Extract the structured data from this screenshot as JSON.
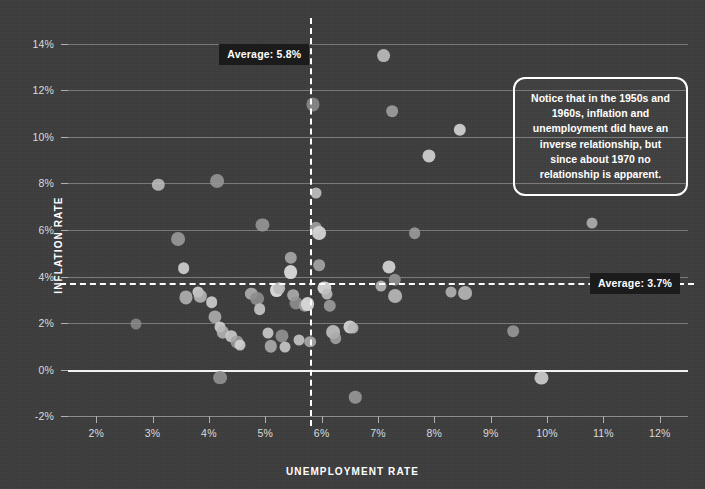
{
  "chart_data": {
    "type": "scatter",
    "title": "",
    "xlabel": "UNEMPLOYMENT RATE",
    "ylabel": "INFLATION RATE",
    "xlim": [
      1.5,
      12.5
    ],
    "ylim": [
      -2.6,
      14.6
    ],
    "xticks": [
      "2%",
      "3%",
      "4%",
      "5%",
      "6%",
      "7%",
      "8%",
      "9%",
      "10%",
      "11%",
      "12%"
    ],
    "xtick_values": [
      2,
      3,
      4,
      5,
      6,
      7,
      8,
      9,
      10,
      11,
      12
    ],
    "yticks": [
      "14%",
      "12%",
      "10%",
      "8%",
      "6%",
      "4%",
      "2%",
      "0%",
      "-2%"
    ],
    "ytick_values": [
      14,
      12,
      10,
      8,
      6,
      4,
      2,
      0,
      -2
    ],
    "grid": "horizontal",
    "legend": "none",
    "points": [
      {
        "x": 2.7,
        "y": 1.95
      },
      {
        "x": 3.1,
        "y": 7.95
      },
      {
        "x": 3.45,
        "y": 5.6
      },
      {
        "x": 3.55,
        "y": 4.35
      },
      {
        "x": 3.6,
        "y": 3.1
      },
      {
        "x": 3.8,
        "y": 3.35
      },
      {
        "x": 3.85,
        "y": 3.15
      },
      {
        "x": 4.15,
        "y": 8.1
      },
      {
        "x": 4.05,
        "y": 2.9
      },
      {
        "x": 4.1,
        "y": 2.25
      },
      {
        "x": 4.2,
        "y": 1.85
      },
      {
        "x": 4.25,
        "y": 1.6
      },
      {
        "x": 4.2,
        "y": -0.35
      },
      {
        "x": 4.4,
        "y": 1.45
      },
      {
        "x": 4.5,
        "y": 1.2
      },
      {
        "x": 4.55,
        "y": 1.05
      },
      {
        "x": 4.75,
        "y": 3.25
      },
      {
        "x": 4.85,
        "y": 3.05
      },
      {
        "x": 4.9,
        "y": 2.6
      },
      {
        "x": 4.95,
        "y": 6.2
      },
      {
        "x": 5.05,
        "y": 1.55
      },
      {
        "x": 5.1,
        "y": 1.0
      },
      {
        "x": 5.2,
        "y": 3.4
      },
      {
        "x": 5.25,
        "y": 3.5
      },
      {
        "x": 5.3,
        "y": 1.45
      },
      {
        "x": 5.35,
        "y": 0.95
      },
      {
        "x": 5.45,
        "y": 4.8
      },
      {
        "x": 5.45,
        "y": 4.2
      },
      {
        "x": 5.5,
        "y": 3.2
      },
      {
        "x": 5.55,
        "y": 2.85
      },
      {
        "x": 5.6,
        "y": 1.25
      },
      {
        "x": 5.7,
        "y": 2.75
      },
      {
        "x": 5.75,
        "y": 2.8
      },
      {
        "x": 5.8,
        "y": 1.2
      },
      {
        "x": 5.85,
        "y": 11.4
      },
      {
        "x": 5.9,
        "y": 7.6
      },
      {
        "x": 5.9,
        "y": 6.1
      },
      {
        "x": 5.95,
        "y": 5.85
      },
      {
        "x": 5.95,
        "y": 4.5
      },
      {
        "x": 6.05,
        "y": 3.5
      },
      {
        "x": 6.1,
        "y": 3.25
      },
      {
        "x": 6.15,
        "y": 2.75
      },
      {
        "x": 6.2,
        "y": 1.6
      },
      {
        "x": 6.25,
        "y": 1.35
      },
      {
        "x": 6.5,
        "y": 1.85
      },
      {
        "x": 6.55,
        "y": 1.8
      },
      {
        "x": 6.6,
        "y": -1.2
      },
      {
        "x": 7.1,
        "y": 13.5
      },
      {
        "x": 7.25,
        "y": 11.1
      },
      {
        "x": 7.2,
        "y": 4.4
      },
      {
        "x": 7.05,
        "y": 3.6
      },
      {
        "x": 7.3,
        "y": 3.85
      },
      {
        "x": 7.3,
        "y": 3.15
      },
      {
        "x": 7.65,
        "y": 5.85
      },
      {
        "x": 7.9,
        "y": 9.2
      },
      {
        "x": 8.3,
        "y": 3.35
      },
      {
        "x": 8.45,
        "y": 10.3
      },
      {
        "x": 8.55,
        "y": 3.3
      },
      {
        "x": 9.4,
        "y": 1.65
      },
      {
        "x": 9.9,
        "y": -0.35
      },
      {
        "x": 10.8,
        "y": 6.3
      }
    ],
    "average_lines": [
      {
        "orientation": "vertical",
        "value": 5.8,
        "label": "Average: 5.8%"
      },
      {
        "orientation": "horizontal",
        "value": 3.7,
        "label": "Average: 3.7%"
      }
    ],
    "annotation": "Notice that in the 1950s and 1960s, inflation and unemployment did have an inverse relationship, but since about 1970 no relationship is apparent.",
    "colors": {
      "background": "#3d3d3d",
      "gridline": "#8e8e8e",
      "zero_line": "#f2f2f2",
      "average_line": "#ffffff",
      "badge_background": "#1b1b1b",
      "text": "#e8e8e8",
      "point": "#b4b4b4"
    }
  }
}
